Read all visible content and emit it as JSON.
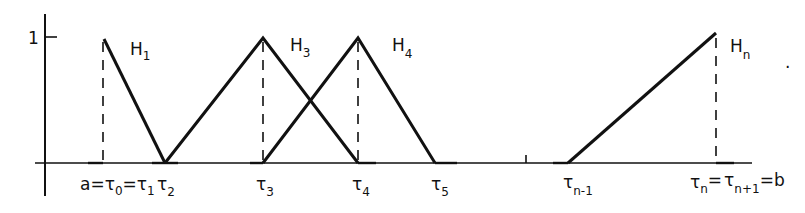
{
  "diagram": {
    "y_tick_label": "1",
    "functions": [
      {
        "name": "H",
        "sub": "1"
      },
      {
        "name": "H",
        "sub": "3"
      },
      {
        "name": "H",
        "sub": "4"
      },
      {
        "name": "H",
        "sub": "n"
      }
    ],
    "knots": [
      {
        "prefix": "a=",
        "sym": "τ",
        "sub": "0",
        "mid": "=",
        "sym2": "τ",
        "sub2": "1"
      },
      {
        "sym": "τ",
        "sub": "2"
      },
      {
        "sym": "τ",
        "sub": "3"
      },
      {
        "sym": "τ",
        "sub": "4"
      },
      {
        "sym": "τ",
        "sub": "5"
      },
      {
        "sym": "τ",
        "sub": "n-1"
      },
      {
        "sym": "τ",
        "sub": "n",
        "mid": "=",
        "sym2": "τ",
        "sub2": "n+1",
        "suffix": "=b"
      }
    ],
    "trailing_mark": "."
  }
}
